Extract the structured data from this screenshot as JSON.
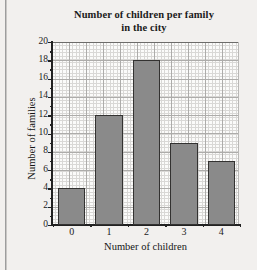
{
  "chart_data": {
    "type": "bar",
    "title": "Number of children per family in the city",
    "title_line1": "Number of children per family",
    "title_line2": "in the city",
    "xlabel": "Number of children",
    "ylabel": "Number of families",
    "categories": [
      "0",
      "1",
      "2",
      "3",
      "4"
    ],
    "values": [
      4,
      12,
      18,
      9,
      7
    ],
    "ylim": [
      0,
      20
    ],
    "ytick_step": 2,
    "yticks": [
      "20",
      "18",
      "16",
      "14",
      "12",
      "10",
      "8",
      "6",
      "4",
      "2",
      "0"
    ],
    "xticks": [
      "0",
      "1",
      "2",
      "3",
      "4"
    ],
    "grid": "graph-paper fine grid with major lines every 5 cells",
    "legend": "none",
    "legend_position": "none",
    "bar_fill_color": "#8a8a8a",
    "bar_border_color": "#333231",
    "background_color": "#f2f0ee",
    "plot_background_color": "#fbfbfa",
    "grid_color_fine": "#d9d8d6",
    "grid_color_major": "#adacaa",
    "axis_color": "#222222",
    "text_color": "#1b1b1b"
  }
}
